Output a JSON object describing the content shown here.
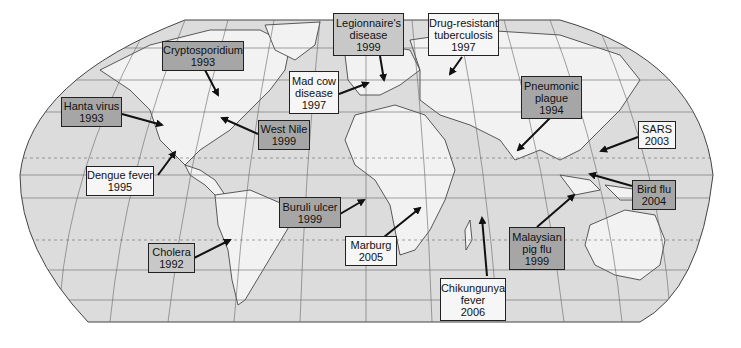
{
  "map": {
    "colors": {
      "ocean": "#dcdcdc",
      "land": "#f2f2f2",
      "border": "#333333",
      "grid": "#555555"
    },
    "labels": [
      {
        "id": "cryptosporidium",
        "lines": [
          "Cryptosporidium",
          "1993"
        ],
        "shade": "dark"
      },
      {
        "id": "hanta-virus",
        "lines": [
          "Hanta virus",
          "1993"
        ],
        "shade": "dark"
      },
      {
        "id": "west-nile",
        "lines": [
          "West Nile",
          "1999"
        ],
        "shade": "dark"
      },
      {
        "id": "dengue-fever",
        "lines": [
          "Dengue fever",
          "1995"
        ],
        "shade": "light"
      },
      {
        "id": "cholera",
        "lines": [
          "Cholera",
          "1992"
        ],
        "shade": "mid"
      },
      {
        "id": "mad-cow",
        "lines": [
          "Mad cow",
          "disease",
          "1997"
        ],
        "shade": "light"
      },
      {
        "id": "legionnaires",
        "lines": [
          "Legionnaire's",
          "disease",
          "1999"
        ],
        "shade": "mid"
      },
      {
        "id": "drug-resistant-tb",
        "lines": [
          "Drug-resistant",
          "tuberculosis",
          "1997"
        ],
        "shade": "light"
      },
      {
        "id": "pneumonic-plague",
        "lines": [
          "Pneumonic",
          "plague",
          "1994"
        ],
        "shade": "dark"
      },
      {
        "id": "sars",
        "lines": [
          "SARS",
          "2003"
        ],
        "shade": "light"
      },
      {
        "id": "buruli-ulcer",
        "lines": [
          "Buruli ulcer",
          "1999"
        ],
        "shade": "dark"
      },
      {
        "id": "marburg",
        "lines": [
          "Marburg",
          "2005"
        ],
        "shade": "light"
      },
      {
        "id": "bird-flu",
        "lines": [
          "Bird flu",
          "2004"
        ],
        "shade": "dark"
      },
      {
        "id": "malaysian-pig-flu",
        "lines": [
          "Malaysian",
          "pig flu",
          "1999"
        ],
        "shade": "dark"
      },
      {
        "id": "chikungunya",
        "lines": [
          "Chikungunya",
          "fever",
          "2006"
        ],
        "shade": "light"
      }
    ]
  }
}
